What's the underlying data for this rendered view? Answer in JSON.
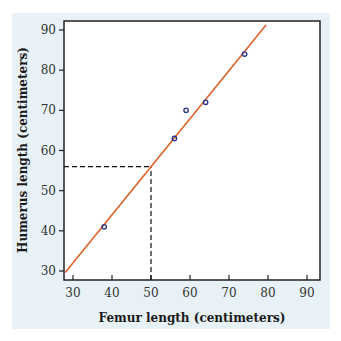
{
  "chart_data": {
    "type": "scatter",
    "title": "",
    "xlabel": "Femur length (centimeters)",
    "ylabel": "Humerus length (centimeters)",
    "xlim": [
      28,
      93
    ],
    "ylim": [
      28,
      92
    ],
    "xticks": [
      30,
      40,
      50,
      60,
      70,
      80,
      90
    ],
    "yticks": [
      30,
      40,
      50,
      60,
      70,
      80,
      90
    ],
    "grid": false,
    "legend": null,
    "series": [
      {
        "name": "observations",
        "type": "scatter",
        "color": "#2b3a8f",
        "points": [
          {
            "x": 38,
            "y": 41
          },
          {
            "x": 56,
            "y": 63
          },
          {
            "x": 59,
            "y": 70
          },
          {
            "x": 64,
            "y": 72
          },
          {
            "x": 74,
            "y": 84
          }
        ]
      },
      {
        "name": "regression-line",
        "type": "line",
        "color": "#e0622a",
        "slope": 1.197,
        "intercept": -3.9,
        "x_range": [
          28,
          79.5
        ]
      }
    ],
    "annotations": [
      {
        "type": "dashed-guide",
        "x": 50,
        "y": 56,
        "description": "Dashed lines from x=50 up to the regression line and across to the y-axis at about 56"
      }
    ]
  },
  "labels": {
    "x_axis_title": "Femur length (centimeters)",
    "y_axis_title": "Humerus length (centimeters)",
    "x_ticks": [
      "30",
      "40",
      "50",
      "60",
      "70",
      "80",
      "90"
    ],
    "y_ticks": [
      "30",
      "40",
      "50",
      "60",
      "70",
      "80",
      "90"
    ]
  }
}
